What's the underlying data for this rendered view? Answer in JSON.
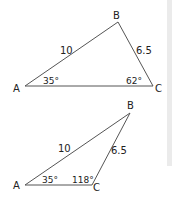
{
  "figure_1": {
    "vertices": {
      "A": "A",
      "B": "B",
      "C": "C"
    },
    "side_AB": "10",
    "side_BC": "6.5",
    "angle_A": "35°",
    "angle_C": "62°"
  },
  "figure_2": {
    "vertices": {
      "A": "A",
      "B": "B",
      "C": "C"
    },
    "side_AB": "10",
    "side_BC": "6.5",
    "angle_A": "35°",
    "angle_C": "118°"
  }
}
